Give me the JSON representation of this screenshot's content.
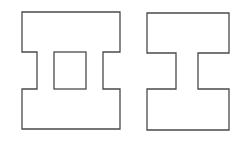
{
  "figure": {
    "stroke_color": "#4a4a4a",
    "background": "#ffffff",
    "shapes": [
      {
        "name": "i-beam-with-hole",
        "outline": "M22 12 H120 V52 H103 V89 H120 V129 H22 V89 H37 V52 H22 Z",
        "hole": {
          "x": 54,
          "y": 52,
          "width": 32,
          "height": 37
        }
      },
      {
        "name": "i-beam-solid",
        "outline": "M147 13 H229 V53 H198 V89 H229 V130 H147 V89 H176 V53 H147 Z"
      }
    ]
  }
}
